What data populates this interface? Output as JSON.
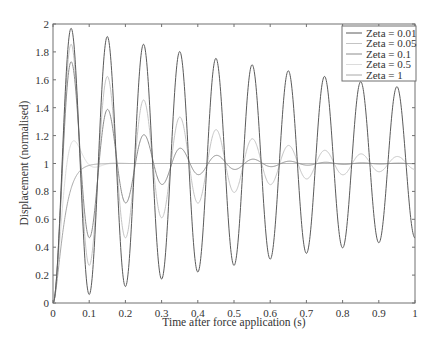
{
  "chart_data": {
    "type": "line",
    "title": "",
    "xlabel": "Time after force application (s)",
    "ylabel": "Displacement (normalised)",
    "xlim": [
      0,
      1
    ],
    "ylim": [
      0,
      2
    ],
    "xticks": [
      "0",
      "0.1",
      "0.2",
      "0.3",
      "0.4",
      "0.5",
      "0.6",
      "0.7",
      "0.8",
      "0.9",
      "1"
    ],
    "yticks": [
      "0",
      "0.2",
      "0.4",
      "0.6",
      "0.8",
      "1",
      "1.2",
      "1.4",
      "1.6",
      "1.8",
      "2"
    ],
    "grid": false,
    "legend_position": "upper right (inside axes)",
    "model": {
      "description": "Unit step response of damped SDOF oscillator",
      "natural_frequency_hz": 10
    },
    "x": [
      0,
      0.05,
      0.1,
      0.15,
      0.2,
      0.25,
      0.3,
      0.35,
      0.4,
      0.45,
      0.5,
      0.55,
      0.6,
      0.65,
      0.7,
      0.75,
      0.8,
      0.85,
      0.9,
      0.95,
      1.0
    ],
    "series": [
      {
        "name": "Zeta = 0.01",
        "zeta": 0.01,
        "color": "#5a5a5a",
        "width": 1.0,
        "values": [
          0,
          1.969,
          0.061,
          1.91,
          0.118,
          1.855,
          0.171,
          1.803,
          0.222,
          1.754,
          0.27,
          1.708,
          0.314,
          1.665,
          0.356,
          1.624,
          0.395,
          1.586,
          0.432,
          1.551,
          0.467
        ]
      },
      {
        "name": "Zeta = 0.05",
        "zeta": 0.05,
        "color": "#c4c4c4",
        "width": 1.0,
        "values": [
          0,
          1.855,
          0.27,
          1.624,
          0.467,
          1.456,
          0.61,
          1.333,
          0.715,
          1.243,
          0.792,
          1.178,
          0.848,
          1.13,
          0.889,
          1.095,
          0.919,
          1.069,
          0.941,
          1.051,
          0.957
        ]
      },
      {
        "name": "Zeta = 0.1",
        "zeta": 0.1,
        "color": "#8c8c8c",
        "width": 1.0,
        "values": [
          0,
          1.73,
          0.467,
          1.39,
          0.715,
          1.208,
          0.848,
          1.111,
          0.919,
          1.059,
          0.957,
          1.032,
          0.977,
          1.017,
          0.988,
          1.009,
          0.993,
          1.005,
          0.996,
          1.003,
          0.998
        ]
      },
      {
        "name": "Zeta = 0.5",
        "zeta": 0.5,
        "color": "#dcdcdc",
        "width": 1.0,
        "values": [
          0,
          1.16,
          1.035,
          0.995,
          1.0,
          1.0,
          1.0,
          1.0,
          1.0,
          1.0,
          1.0,
          1.0,
          1.0,
          1.0,
          1.0,
          1.0,
          1.0,
          1.0,
          1.0,
          1.0,
          1.0
        ]
      },
      {
        "name": "Zeta = 1",
        "zeta": 1.0,
        "color": "#a8a8a8",
        "width": 1.0,
        "values": [
          0,
          0.865,
          0.986,
          0.999,
          1.0,
          1.0,
          1.0,
          1.0,
          1.0,
          1.0,
          1.0,
          1.0,
          1.0,
          1.0,
          1.0,
          1.0,
          1.0,
          1.0,
          1.0,
          1.0,
          1.0
        ]
      }
    ]
  },
  "layout": {
    "plot_left": 53,
    "plot_right": 415,
    "plot_top": 24,
    "plot_bottom": 303,
    "axis_color": "#707070",
    "tick_length": 3
  }
}
